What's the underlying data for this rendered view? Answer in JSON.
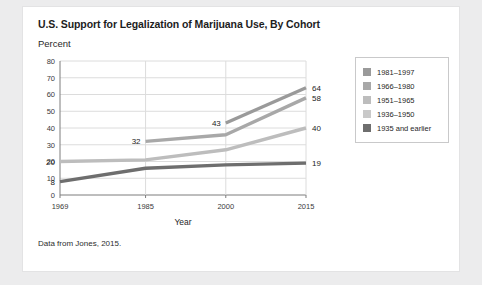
{
  "card": {
    "footnote": "Data from Jones, 2015."
  },
  "chart_data": {
    "type": "line",
    "title": "U.S. Support for Legalization of Marijuana Use, By Cohort",
    "subtitle": "Percent",
    "xlabel": "Year",
    "ylabel": "Percent",
    "x": [
      1969,
      1985,
      2000,
      2015
    ],
    "xlim": [
      1969,
      2015
    ],
    "ylim": [
      0,
      80
    ],
    "ytick_step": 10,
    "yticks": [
      "0",
      "10",
      "20",
      "30",
      "40",
      "50",
      "60",
      "70",
      "80"
    ],
    "xticks": [
      "1969",
      "1985",
      "2000",
      "2015"
    ],
    "grid": true,
    "legend_position": "right",
    "series": [
      {
        "name": "1981–1997",
        "color": "#9a9a9a",
        "x": [
          2000,
          2015
        ],
        "values": [
          43,
          64
        ],
        "labels": [
          {
            "text": "43",
            "x": 2000,
            "value": 43,
            "align": "left"
          },
          {
            "text": "64",
            "x": 2015,
            "value": 64,
            "align": "right"
          }
        ]
      },
      {
        "name": "1966–1980",
        "color": "#a8a8a8",
        "x": [
          1985,
          2000,
          2015
        ],
        "values": [
          32,
          36,
          58
        ],
        "labels": [
          {
            "text": "32",
            "x": 1985,
            "value": 32,
            "align": "left"
          },
          {
            "text": "58",
            "x": 2015,
            "value": 58,
            "align": "right"
          }
        ]
      },
      {
        "name": "1951–1965",
        "color": "#bdbdbd",
        "x": [
          1969,
          1985,
          2000,
          2015
        ],
        "values": [
          20,
          21,
          27,
          40
        ],
        "labels": [
          {
            "text": "20",
            "x": 1969,
            "value": 20,
            "align": "left"
          },
          {
            "text": "40",
            "x": 2015,
            "value": 40,
            "align": "right"
          }
        ]
      },
      {
        "name": "1936–1950",
        "color": "#c9c9c9",
        "x": [],
        "values": [],
        "labels": []
      },
      {
        "name": "1935 and earlier",
        "color": "#6e6e6e",
        "x": [
          1969,
          1985,
          2000,
          2015
        ],
        "values": [
          8,
          16,
          18,
          19
        ],
        "labels": [
          {
            "text": "8",
            "x": 1969,
            "value": 8,
            "align": "left"
          },
          {
            "text": "19",
            "x": 2015,
            "value": 19,
            "align": "right"
          }
        ]
      }
    ]
  },
  "legend": {
    "items": [
      {
        "label": "1981–1997",
        "color": "#9a9a9a"
      },
      {
        "label": "1966–1980",
        "color": "#a8a8a8"
      },
      {
        "label": "1951–1965",
        "color": "#bdbdbd"
      },
      {
        "label": "1936–1950",
        "color": "#c9c9c9"
      },
      {
        "label": "1935 and earlier",
        "color": "#6e6e6e"
      }
    ]
  }
}
